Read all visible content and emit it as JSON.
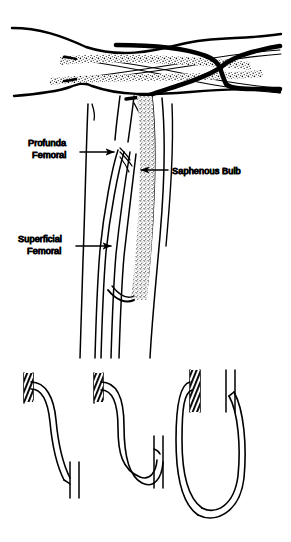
{
  "figure": {
    "background_color": "#ffffff",
    "ink_color": "#000000",
    "panels": [
      {
        "id": "panel-longitudinal-vessels",
        "name": "longitudinal-vessel-junction-view",
        "description": "Horizontal longitudinal view of femoral vessel confluence with thick dark vessels and stippled vein walls",
        "labels": []
      },
      {
        "id": "panel-femoral-anatomy",
        "name": "femoral-vein-anatomy-view",
        "description": "Vertical anatomic view of femoral vessels with saphenous bulb",
        "labels": [
          {
            "key": "profunda_femoral",
            "line1": "Profunda",
            "line2": "Femoral",
            "arrow_direction": "right",
            "text_x": 28,
            "text_y": 146,
            "arrow_from_x": 80,
            "arrow_from_y": 152,
            "arrow_to_x": 118,
            "arrow_to_y": 152
          },
          {
            "key": "saphenous_bulb",
            "line1": "Saphenous Bulb",
            "line2": "",
            "arrow_direction": "left",
            "text_x": 172,
            "text_y": 173,
            "arrow_from_x": 168,
            "arrow_from_y": 170,
            "arrow_to_x": 137,
            "arrow_to_y": 170
          },
          {
            "key": "superficial_femoral",
            "line1": "Superficial",
            "line2": "Femoral",
            "arrow_direction": "right",
            "text_x": 18,
            "text_y": 242,
            "arrow_from_x": 76,
            "arrow_from_y": 246,
            "arrow_to_x": 115,
            "arrow_to_y": 246
          }
        ]
      },
      {
        "id": "panel-graft-configurations",
        "name": "vein-graft-loop-configurations",
        "description": "Three schematic vein graft configurations: gentle S-curve, U-loop, and long elongated loop",
        "grafts": [
          {
            "key": "graft_short_curve",
            "shape": "s-curve",
            "index": 1
          },
          {
            "key": "graft_u_loop",
            "shape": "u-loop",
            "index": 2
          },
          {
            "key": "graft_long_loop",
            "shape": "long-loop",
            "index": 3
          }
        ],
        "labels": []
      }
    ]
  },
  "labels": {
    "profunda_femoral_line1": "Profunda",
    "profunda_femoral_line2": "Femoral",
    "saphenous_bulb": "Saphenous Bulb",
    "superficial_femoral_line1": "Superficial",
    "superficial_femoral_line2": "Femoral"
  }
}
